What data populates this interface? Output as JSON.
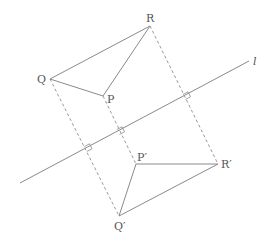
{
  "diagram": {
    "colors": {
      "stroke": "#8a8a8a",
      "dashed": "#9a9a9a",
      "label": "#555555"
    },
    "line": {
      "label": "l"
    },
    "points": {
      "Q": {
        "label": "Q",
        "x": 50,
        "y": 79
      },
      "P": {
        "label": "P",
        "x": 103,
        "y": 96
      },
      "R": {
        "label": "R",
        "x": 150,
        "y": 26
      },
      "Q_prime": {
        "label": "Q′",
        "x": 119,
        "y": 216
      },
      "P_prime": {
        "label": "P′",
        "x": 136,
        "y": 164
      },
      "R_prime": {
        "label": "R′",
        "x": 218,
        "y": 164
      }
    }
  }
}
